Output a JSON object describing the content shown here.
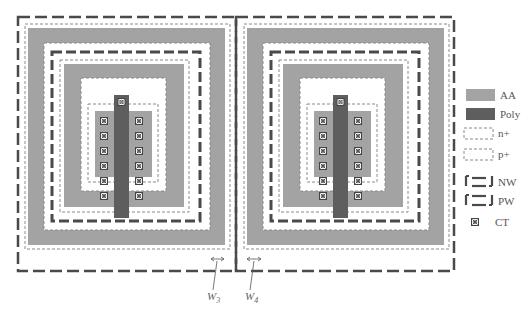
{
  "figure": {
    "type": "layout-diagram"
  },
  "colors": {
    "aa": "#a3a3a3",
    "poly": "#5e5e5e",
    "implant_outline": "#8a8a8a",
    "well_outline": "#4a4a4a",
    "ct_fill": "#777777",
    "text": "#555555"
  },
  "legend": {
    "items": [
      {
        "key": "aa",
        "label": "AA"
      },
      {
        "key": "poly",
        "label": "Poly"
      },
      {
        "key": "nplus",
        "label": "n+"
      },
      {
        "key": "pplus",
        "label": "p+"
      },
      {
        "key": "nw",
        "label": "NW"
      },
      {
        "key": "pw",
        "label": "PW"
      },
      {
        "key": "ct",
        "label": "CT"
      }
    ]
  },
  "cells": [
    {
      "name": "left-cell",
      "contacts_per_column": 6,
      "contact_columns": 2
    },
    {
      "name": "right-cell",
      "contacts_per_column": 6,
      "contact_columns": 2
    }
  ],
  "annotations": {
    "w3": {
      "base": "W",
      "sub": "3"
    },
    "w4": {
      "base": "W",
      "sub": "4"
    }
  }
}
